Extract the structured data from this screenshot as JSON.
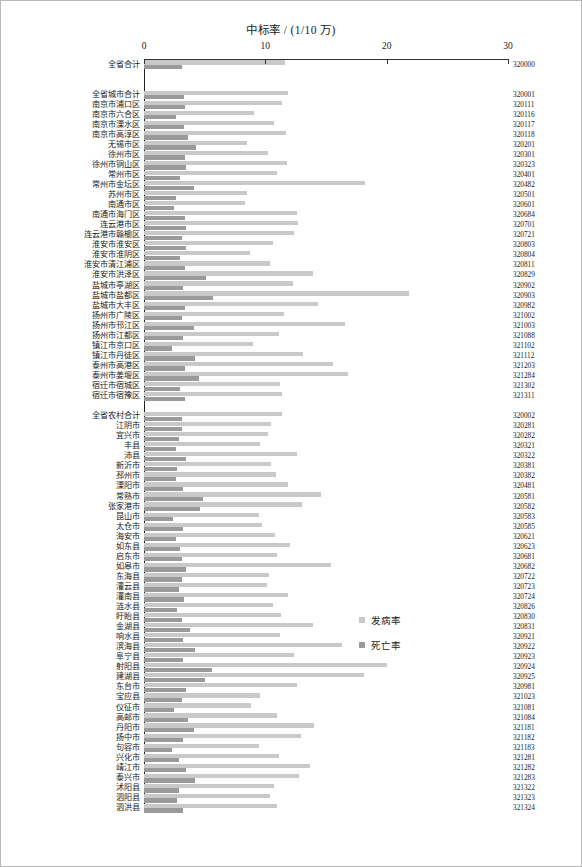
{
  "chart_data": {
    "type": "bar",
    "orientation": "horizontal",
    "title": "中标率 / (1/10 万)",
    "xlabel": "",
    "ylabel": "",
    "xlim": [
      0,
      30
    ],
    "xticks": [
      0,
      10,
      20,
      30
    ],
    "grid": false,
    "legend_position": "center-right",
    "series": [
      {
        "name": "发病率",
        "color": "#c9c9c9"
      },
      {
        "name": "死亡率",
        "color": "#9a9a9a"
      }
    ],
    "groups": [
      {
        "name": "全省合计",
        "rows": [
          {
            "label": "全省合计",
            "code": "320000",
            "incidence": 11.6,
            "mortality": 3.1
          }
        ]
      },
      {
        "name": "全省城市合计",
        "rows": [
          {
            "label": "全省城市合计",
            "code": "320001",
            "incidence": 11.9,
            "mortality": 3.3
          },
          {
            "label": "南京市浦口区",
            "code": "320111",
            "incidence": 11.4,
            "mortality": 3.4
          },
          {
            "label": "南京市六合区",
            "code": "320116",
            "incidence": 9.1,
            "mortality": 2.6
          },
          {
            "label": "南京市溧水区",
            "code": "320117",
            "incidence": 10.7,
            "mortality": 3.3
          },
          {
            "label": "南京市高淳区",
            "code": "320118",
            "incidence": 11.7,
            "mortality": 3.6
          },
          {
            "label": "无锡市区",
            "code": "320201",
            "incidence": 8.5,
            "mortality": 4.3
          },
          {
            "label": "徐州市区",
            "code": "320301",
            "incidence": 10.2,
            "mortality": 3.4
          },
          {
            "label": "徐州市铜山区",
            "code": "320323",
            "incidence": 11.8,
            "mortality": 3.5
          },
          {
            "label": "常州市区",
            "code": "320401",
            "incidence": 11.0,
            "mortality": 3.0
          },
          {
            "label": "常州市金坛区",
            "code": "320482",
            "incidence": 18.2,
            "mortality": 4.1
          },
          {
            "label": "苏州市区",
            "code": "320501",
            "incidence": 8.5,
            "mortality": 2.6
          },
          {
            "label": "南通市区",
            "code": "320601",
            "incidence": 8.3,
            "mortality": 2.5
          },
          {
            "label": "南通市海门区",
            "code": "320684",
            "incidence": 12.6,
            "mortality": 3.4
          },
          {
            "label": "连云港市区",
            "code": "320701",
            "incidence": 12.7,
            "mortality": 3.5
          },
          {
            "label": "连云港市赣榆区",
            "code": "320721",
            "incidence": 12.4,
            "mortality": 3.1
          },
          {
            "label": "淮安市淮安区",
            "code": "320803",
            "incidence": 10.6,
            "mortality": 3.5
          },
          {
            "label": "淮安市淮阴区",
            "code": "320804",
            "incidence": 8.7,
            "mortality": 3.0
          },
          {
            "label": "淮安市清江浦区",
            "code": "320811",
            "incidence": 10.4,
            "mortality": 3.4
          },
          {
            "label": "淮安市洪泽区",
            "code": "320829",
            "incidence": 13.9,
            "mortality": 5.1
          },
          {
            "label": "盐城市亭湖区",
            "code": "320902",
            "incidence": 12.3,
            "mortality": 3.2
          },
          {
            "label": "盐城市盐都区",
            "code": "320903",
            "incidence": 21.8,
            "mortality": 5.7
          },
          {
            "label": "盐城市大丰区",
            "code": "320982",
            "incidence": 14.3,
            "mortality": 3.4
          },
          {
            "label": "扬州市广陵区",
            "code": "321002",
            "incidence": 11.5,
            "mortality": 3.1
          },
          {
            "label": "扬州市邗江区",
            "code": "321003",
            "incidence": 16.6,
            "mortality": 4.1
          },
          {
            "label": "扬州市江都区",
            "code": "321088",
            "incidence": 11.1,
            "mortality": 3.2
          },
          {
            "label": "镇江市京口区",
            "code": "321102",
            "incidence": 9.0,
            "mortality": 2.3
          },
          {
            "label": "镇江市丹徒区",
            "code": "321112",
            "incidence": 13.1,
            "mortality": 4.2
          },
          {
            "label": "泰州市高港区",
            "code": "321203",
            "incidence": 15.6,
            "mortality": 3.4
          },
          {
            "label": "泰州市姜堰区",
            "code": "321284",
            "incidence": 16.8,
            "mortality": 4.5
          },
          {
            "label": "宿迁市宿城区",
            "code": "321302",
            "incidence": 11.2,
            "mortality": 3.0
          },
          {
            "label": "宿迁市宿豫区",
            "code": "321311",
            "incidence": 11.4,
            "mortality": 3.4
          }
        ]
      },
      {
        "name": "全省农村合计",
        "rows": [
          {
            "label": "全省农村合计",
            "code": "320002",
            "incidence": 11.4,
            "mortality": 3.1
          },
          {
            "label": "江阴市",
            "code": "320281",
            "incidence": 10.5,
            "mortality": 3.1
          },
          {
            "label": "宜兴市",
            "code": "320282",
            "incidence": 10.2,
            "mortality": 2.9
          },
          {
            "label": "丰县",
            "code": "320321",
            "incidence": 9.6,
            "mortality": 2.6
          },
          {
            "label": "沛县",
            "code": "320322",
            "incidence": 12.6,
            "mortality": 3.5
          },
          {
            "label": "新沂市",
            "code": "320381",
            "incidence": 10.5,
            "mortality": 2.7
          },
          {
            "label": "邳州市",
            "code": "320382",
            "incidence": 10.9,
            "mortality": 2.6
          },
          {
            "label": "溧阳市",
            "code": "320481",
            "incidence": 11.9,
            "mortality": 3.2
          },
          {
            "label": "常熟市",
            "code": "320581",
            "incidence": 14.6,
            "mortality": 4.9
          },
          {
            "label": "张家港市",
            "code": "320582",
            "incidence": 13.0,
            "mortality": 4.6
          },
          {
            "label": "昆山市",
            "code": "320583",
            "incidence": 9.5,
            "mortality": 2.4
          },
          {
            "label": "太仓市",
            "code": "320585",
            "incidence": 9.7,
            "mortality": 3.2
          },
          {
            "label": "海安市",
            "code": "320621",
            "incidence": 10.8,
            "mortality": 2.6
          },
          {
            "label": "如东县",
            "code": "320623",
            "incidence": 12.0,
            "mortality": 3.0
          },
          {
            "label": "启东市",
            "code": "320681",
            "incidence": 11.0,
            "mortality": 3.1
          },
          {
            "label": "如皋市",
            "code": "320682",
            "incidence": 15.4,
            "mortality": 3.5
          },
          {
            "label": "东海县",
            "code": "320722",
            "incidence": 10.3,
            "mortality": 3.1
          },
          {
            "label": "灌云县",
            "code": "320723",
            "incidence": 10.1,
            "mortality": 2.9
          },
          {
            "label": "灌南县",
            "code": "320724",
            "incidence": 11.9,
            "mortality": 3.3
          },
          {
            "label": "涟水县",
            "code": "320826",
            "incidence": 10.6,
            "mortality": 2.7
          },
          {
            "label": "盱眙县",
            "code": "320830",
            "incidence": 11.3,
            "mortality": 3.1
          },
          {
            "label": "金湖县",
            "code": "320831",
            "incidence": 13.9,
            "mortality": 3.8
          },
          {
            "label": "响水县",
            "code": "320921",
            "incidence": 11.2,
            "mortality": 3.2
          },
          {
            "label": "滨海县",
            "code": "320922",
            "incidence": 16.3,
            "mortality": 4.2
          },
          {
            "label": "阜宁县",
            "code": "320923",
            "incidence": 12.4,
            "mortality": 3.2
          },
          {
            "label": "射阳县",
            "code": "320924",
            "incidence": 20.0,
            "mortality": 5.6
          },
          {
            "label": "建湖县",
            "code": "320925",
            "incidence": 18.1,
            "mortality": 5.0
          },
          {
            "label": "东台市",
            "code": "320981",
            "incidence": 12.6,
            "mortality": 3.5
          },
          {
            "label": "宝应县",
            "code": "321023",
            "incidence": 9.6,
            "mortality": 3.1
          },
          {
            "label": "仪征市",
            "code": "321081",
            "incidence": 8.8,
            "mortality": 2.5
          },
          {
            "label": "高邮市",
            "code": "321084",
            "incidence": 11.0,
            "mortality": 3.6
          },
          {
            "label": "丹阳市",
            "code": "321181",
            "incidence": 14.0,
            "mortality": 4.1
          },
          {
            "label": "扬中市",
            "code": "321182",
            "incidence": 12.9,
            "mortality": 3.2
          },
          {
            "label": "句容市",
            "code": "321183",
            "incidence": 9.5,
            "mortality": 2.3
          },
          {
            "label": "兴化市",
            "code": "321281",
            "incidence": 11.1,
            "mortality": 2.9
          },
          {
            "label": "靖江市",
            "code": "321282",
            "incidence": 13.7,
            "mortality": 3.5
          },
          {
            "label": "泰兴市",
            "code": "321283",
            "incidence": 12.8,
            "mortality": 4.2
          },
          {
            "label": "沭阳县",
            "code": "321322",
            "incidence": 10.7,
            "mortality": 2.9
          },
          {
            "label": "泗阳县",
            "code": "321323",
            "incidence": 10.4,
            "mortality": 2.7
          },
          {
            "label": "泗洪县",
            "code": "321324",
            "incidence": 11.0,
            "mortality": 3.2
          }
        ]
      }
    ]
  }
}
